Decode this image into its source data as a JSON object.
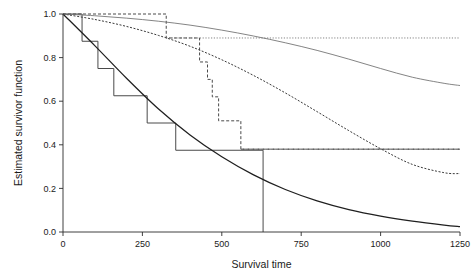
{
  "chart_data": {
    "type": "line",
    "title": "",
    "subtitle": "",
    "xlabel": "Survival time",
    "ylabel": "Estimated survivor function",
    "xlim": [
      0,
      1250
    ],
    "ylim": [
      0.0,
      1.0
    ],
    "xticks": [
      0,
      250,
      500,
      750,
      1000,
      1250
    ],
    "xticklabels": [
      "0",
      "250",
      "500",
      "750",
      "1000",
      "1250"
    ],
    "yticks": [
      0.0,
      0.2,
      0.4,
      0.6,
      0.8,
      1.0
    ],
    "yticklabels": [
      "0.0",
      "0.2",
      "0.4",
      "0.6",
      "0.8",
      "1.0"
    ],
    "grid": false,
    "legend": "none",
    "series": [
      {
        "name": "Kaplan-Meier group 1 (solid step)",
        "style": "step-solid",
        "color": "#4a4a4a",
        "x": [
          0,
          60,
          60,
          110,
          110,
          160,
          160,
          265,
          265,
          355,
          355,
          630,
          630
        ],
        "y": [
          1.0,
          1.0,
          0.875,
          0.875,
          0.75,
          0.75,
          0.625,
          0.625,
          0.5,
          0.5,
          0.375,
          0.375,
          0.0
        ]
      },
      {
        "name": "Kaplan-Meier group 2 (dashed step)",
        "style": "step-dashed",
        "color": "#4a4a4a",
        "x": [
          0,
          325,
          325,
          430,
          430,
          455,
          455,
          470,
          470,
          490,
          490,
          560,
          560,
          1250
        ],
        "y": [
          1.0,
          1.0,
          0.89,
          0.89,
          0.78,
          0.78,
          0.7,
          0.7,
          0.62,
          0.62,
          0.51,
          0.51,
          0.38,
          0.38
        ]
      },
      {
        "name": "Fitted survivor curve group 1 (solid)",
        "style": "smooth-solid",
        "color": "#1f1f1f",
        "x": [
          0,
          100,
          200,
          300,
          400,
          500,
          600,
          700,
          800,
          900,
          1000,
          1100,
          1200,
          1250
        ],
        "y": [
          1.0,
          0.855,
          0.705,
          0.565,
          0.445,
          0.345,
          0.262,
          0.195,
          0.143,
          0.103,
          0.073,
          0.05,
          0.032,
          0.025
        ]
      },
      {
        "name": "Fitted survivor curve group 2 (dashed)",
        "style": "smooth-dashed",
        "color": "#3a3a3a",
        "x": [
          0,
          100,
          200,
          300,
          400,
          500,
          600,
          700,
          800,
          900,
          1000,
          1100,
          1200,
          1250
        ],
        "y": [
          1.0,
          0.975,
          0.943,
          0.902,
          0.852,
          0.79,
          0.718,
          0.638,
          0.552,
          0.465,
          0.382,
          0.31,
          0.272,
          0.268
        ]
      },
      {
        "name": "Fitted survivor curve group 2 upper (thin)",
        "style": "smooth-thin",
        "color": "#6e6e6e",
        "x": [
          0,
          100,
          200,
          300,
          400,
          500,
          600,
          700,
          800,
          900,
          1000,
          1100,
          1200,
          1250
        ],
        "y": [
          1.0,
          0.992,
          0.981,
          0.967,
          0.949,
          0.926,
          0.899,
          0.868,
          0.833,
          0.793,
          0.75,
          0.71,
          0.682,
          0.672
        ]
      },
      {
        "name": "Plateau group 2 upper (dotted flat)",
        "style": "flat-dotted-upper",
        "color": "#9a9a9a",
        "x": [
          325,
          1250
        ],
        "y": [
          0.89,
          0.89
        ]
      },
      {
        "name": "Plateau group 2 lower (dashed flat)",
        "style": "flat-dashed-lower",
        "color": "#7a7a7a",
        "x": [
          560,
          1250
        ],
        "y": [
          0.38,
          0.38
        ]
      }
    ]
  }
}
